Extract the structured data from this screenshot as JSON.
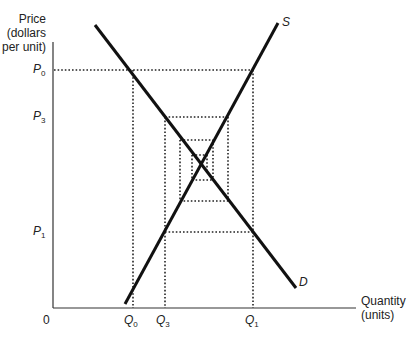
{
  "header": {
    "cut_off_caption": "· · · · · · · · · · · · · ·"
  },
  "axes": {
    "y_title_line1": "Price",
    "y_title_line2": "(dollars",
    "y_title_line3": "per unit)",
    "x_title_line1": "Quantity",
    "x_title_line2": "(units)",
    "origin": "0"
  },
  "price_labels": {
    "p0": {
      "letter": "P",
      "sub": "0"
    },
    "p3": {
      "letter": "P",
      "sub": "3"
    },
    "p1": {
      "letter": "P",
      "sub": "1"
    }
  },
  "quantity_labels": {
    "q0": {
      "letter": "Q",
      "sub": "0"
    },
    "q3": {
      "letter": "Q",
      "sub": "3"
    },
    "q1": {
      "letter": "Q",
      "sub": "1"
    }
  },
  "curves": {
    "supply": {
      "label": "S"
    },
    "demand": {
      "label": "D"
    }
  },
  "colors": {
    "line": "#111111",
    "dotted": "#222222",
    "text": "#222222"
  }
}
